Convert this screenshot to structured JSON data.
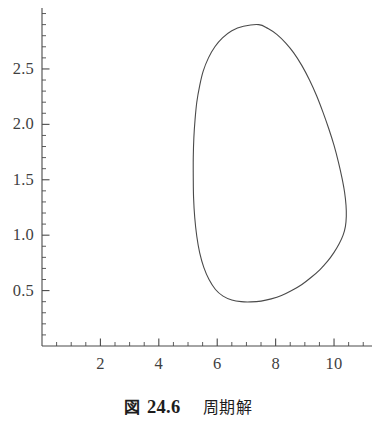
{
  "figure": {
    "caption": {
      "kind_label": "図",
      "number": "24.6",
      "title": "周期解"
    },
    "background_color": "#ffffff",
    "axis_color": "#4a4a4a",
    "curve_color": "#4a4a4a",
    "text_color": "#3f3f3f"
  },
  "chart_data": {
    "type": "line",
    "title": "",
    "subtitle": "",
    "xlabel": "",
    "ylabel": "",
    "grid": false,
    "legend": null,
    "closed_curve": true,
    "xlim": [
      0,
      11.3
    ],
    "ylim": [
      0,
      3.05
    ],
    "x_ticks_major": [
      2,
      4,
      6,
      8,
      10
    ],
    "x_tick_labels": [
      "2",
      "4",
      "6",
      "8",
      "10"
    ],
    "x_ticks_minor": [
      0.5,
      1,
      1.5,
      2.5,
      3,
      3.5,
      4.5,
      5,
      5.5,
      6.5,
      7,
      7.5,
      8.5,
      9,
      9.5,
      10.5,
      11
    ],
    "x_minor_step": 0.5,
    "y_ticks_major": [
      0.5,
      1.0,
      1.5,
      2.0,
      2.5
    ],
    "y_tick_labels": [
      "0.5",
      "1.0",
      "1.5",
      "2.0",
      "2.5"
    ],
    "y_ticks_minor": [
      0.1,
      0.2,
      0.3,
      0.4,
      0.6,
      0.7,
      0.8,
      0.9,
      1.1,
      1.2,
      1.3,
      1.4,
      1.6,
      1.7,
      1.8,
      1.9,
      2.1,
      2.2,
      2.3,
      2.4,
      2.6,
      2.7,
      2.8,
      2.9,
      3.0
    ],
    "y_minor_step": 0.1,
    "series": [
      {
        "name": "periodic orbit",
        "color": "#4a4a4a",
        "line_width": 1.1,
        "closed": true,
        "extremes": {
          "top": [
            7.42,
            2.9
          ],
          "bottom": [
            7.4,
            0.4
          ],
          "left": [
            5.18,
            1.3
          ],
          "right": [
            10.42,
            1.05
          ]
        },
        "points": [
          [
            7.42,
            2.9
          ],
          [
            6.9,
            2.885
          ],
          [
            6.5,
            2.845
          ],
          [
            6.18,
            2.78
          ],
          [
            5.92,
            2.7
          ],
          [
            5.7,
            2.6
          ],
          [
            5.52,
            2.48
          ],
          [
            5.4,
            2.35
          ],
          [
            5.3,
            2.2
          ],
          [
            5.24,
            2.04
          ],
          [
            5.2,
            1.88
          ],
          [
            5.18,
            1.7
          ],
          [
            5.18,
            1.52
          ],
          [
            5.19,
            1.34
          ],
          [
            5.23,
            1.16
          ],
          [
            5.3,
            0.99
          ],
          [
            5.4,
            0.84
          ],
          [
            5.54,
            0.71
          ],
          [
            5.72,
            0.6
          ],
          [
            5.94,
            0.51
          ],
          [
            6.2,
            0.45
          ],
          [
            6.5,
            0.415
          ],
          [
            6.82,
            0.4
          ],
          [
            7.15,
            0.398
          ],
          [
            7.5,
            0.405
          ],
          [
            7.85,
            0.425
          ],
          [
            8.2,
            0.455
          ],
          [
            8.55,
            0.5
          ],
          [
            8.9,
            0.555
          ],
          [
            9.22,
            0.62
          ],
          [
            9.52,
            0.69
          ],
          [
            9.78,
            0.765
          ],
          [
            10.0,
            0.845
          ],
          [
            10.18,
            0.925
          ],
          [
            10.31,
            1.0
          ],
          [
            10.39,
            1.08
          ],
          [
            10.42,
            1.17
          ],
          [
            10.41,
            1.27
          ],
          [
            10.36,
            1.39
          ],
          [
            10.27,
            1.52
          ],
          [
            10.15,
            1.66
          ],
          [
            10.0,
            1.81
          ],
          [
            9.82,
            1.96
          ],
          [
            9.62,
            2.11
          ],
          [
            9.4,
            2.26
          ],
          [
            9.16,
            2.4
          ],
          [
            8.9,
            2.53
          ],
          [
            8.62,
            2.645
          ],
          [
            8.34,
            2.735
          ],
          [
            8.05,
            2.81
          ],
          [
            7.74,
            2.865
          ],
          [
            7.42,
            2.9
          ]
        ]
      }
    ]
  },
  "axes": {
    "x_axis_name": "x-axis",
    "y_axis_name": "y-axis"
  }
}
